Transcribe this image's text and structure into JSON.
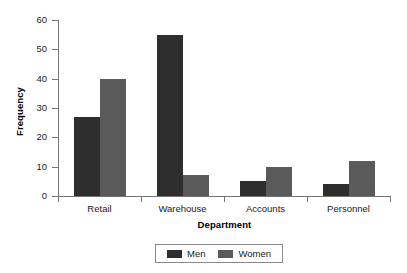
{
  "chart_data": {
    "type": "bar",
    "title": "",
    "xlabel": "Department",
    "ylabel": "Frequency",
    "categories": [
      "Retail",
      "Warehouse",
      "Accounts",
      "Personnel"
    ],
    "series": [
      {
        "name": "Men",
        "color": "#2e2e2e",
        "values": [
          27,
          55,
          5,
          4
        ]
      },
      {
        "name": "Women",
        "color": "#5a5a5a",
        "values": [
          40,
          7,
          10,
          12
        ]
      }
    ],
    "ylim": [
      0,
      60
    ],
    "yticks": [
      0,
      10,
      20,
      30,
      40,
      50,
      60
    ],
    "ytick_labels": [
      "0",
      "10",
      "20",
      "30",
      "40",
      "50",
      "60"
    ],
    "grid": false,
    "legend_position": "bottom",
    "legend_entries": [
      "Men",
      "Women"
    ]
  }
}
